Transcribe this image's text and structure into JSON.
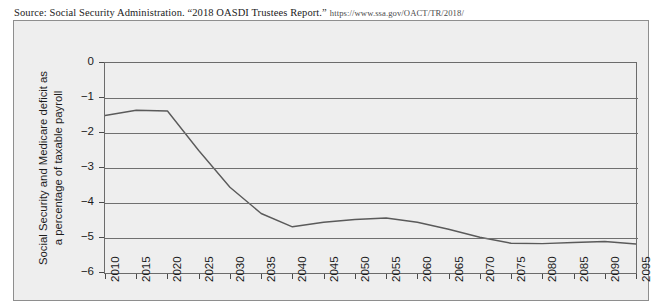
{
  "source": {
    "prefix": "Source: Social Security Administration. “2018 OASDI Trustees Report.”",
    "url": "https://www.ssa.gov/OACT/TR/2018/"
  },
  "colors": {
    "figure_background": "#eeeeee",
    "plot_border": "#6b6b6b",
    "gridline": "#6f6f6f",
    "line_series": "#5a5a5a",
    "text": "#1b1b1b"
  },
  "chart_data": {
    "type": "line",
    "title": "",
    "xlabel": "",
    "ylabel": "Social Security and Medicare deficit as a percentage of taxable payroll",
    "ylabel_lines": [
      "Social Security and Medicare deficit as",
      "a percentage of taxable payroll"
    ],
    "xlim": [
      2010,
      2095
    ],
    "ylim": [
      -6,
      0
    ],
    "yticks": [
      0,
      -1,
      -2,
      -3,
      -4,
      -5,
      -6
    ],
    "ytick_labels": [
      "0",
      "−1",
      "−2",
      "−3",
      "−4",
      "−5",
      "−6"
    ],
    "grid": true,
    "grid_axis": "y",
    "legend": false,
    "categories": [
      "2010",
      "2015",
      "2020",
      "2025",
      "2030",
      "2035",
      "2040",
      "2045",
      "2050",
      "2055",
      "2060",
      "2065",
      "2070",
      "2075",
      "2080",
      "2085",
      "2090",
      "2095"
    ],
    "x": [
      2010,
      2015,
      2020,
      2025,
      2030,
      2035,
      2040,
      2045,
      2050,
      2055,
      2060,
      2065,
      2070,
      2075,
      2080,
      2085,
      2090,
      2095
    ],
    "values": [
      -1.5,
      -1.35,
      -1.37,
      -2.5,
      -3.55,
      -4.3,
      -4.68,
      -4.55,
      -4.47,
      -4.43,
      -4.55,
      -4.75,
      -4.98,
      -5.15,
      -5.16,
      -5.13,
      -5.1,
      -5.17
    ]
  }
}
